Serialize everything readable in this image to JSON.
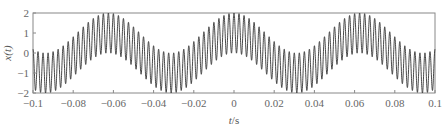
{
  "chart_data": {
    "type": "line",
    "title": "",
    "xlabel": "t/s",
    "ylabel": "x(t)",
    "xlim": [
      -0.1,
      0.1
    ],
    "ylim": [
      -2,
      2
    ],
    "xticks": [
      -0.1,
      -0.08,
      -0.06,
      -0.04,
      -0.02,
      0,
      0.02,
      0.04,
      0.06,
      0.08,
      0.1
    ],
    "xtick_labels": [
      "−0.1",
      "−0.08",
      "−0.06",
      "−0.04",
      "−0.02",
      "0",
      "0.02",
      "0.04",
      "0.06",
      "0.08",
      "0.1"
    ],
    "yticks": [
      2,
      1,
      0,
      -1,
      -2
    ],
    "ytick_labels": [
      "2",
      "1",
      "0",
      "−1",
      "−2"
    ],
    "grid": false,
    "legend": null,
    "series": [
      {
        "name": "x(t)",
        "formula": "cos(2*pi*16*t) + cos(2*pi*400*t)",
        "envelope_frequency_hz": 16,
        "carrier_frequency_hz": 400,
        "color": "#333333",
        "samples": 4000
      }
    ]
  },
  "labels": {
    "xlabel_italic": "t",
    "xlabel_unit": "/s",
    "ylabel": "x(t)"
  }
}
